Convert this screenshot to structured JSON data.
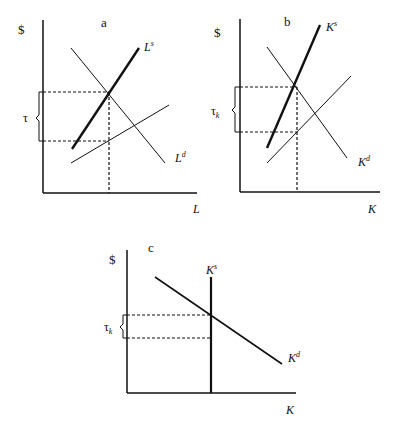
{
  "panels": {
    "a": {
      "label": "a",
      "y_axis_label": "$",
      "x_axis_label": "L",
      "tax_label": "τ",
      "curves": {
        "supply_thick": {
          "base": "L",
          "sup": "s"
        },
        "demand": {
          "base": "L",
          "sup": "d"
        }
      }
    },
    "b": {
      "label": "b",
      "y_axis_label": "$",
      "x_axis_label": "K",
      "tax_label": {
        "base": "τ",
        "sub": "k"
      },
      "curves": {
        "supply_thick": {
          "base": "K",
          "sup": "s"
        },
        "demand": {
          "base": "K",
          "sup": "d"
        }
      }
    },
    "c": {
      "label": "c",
      "y_axis_label": "$",
      "x_axis_label": "K",
      "tax_label": {
        "base": "τ",
        "sub": "k"
      },
      "curves": {
        "supply_vertical": {
          "base": "K",
          "sup": "s"
        },
        "demand": {
          "base": "K",
          "sup": "d"
        }
      }
    }
  },
  "colors": {
    "ink": "#111111",
    "background": "#ffffff"
  }
}
